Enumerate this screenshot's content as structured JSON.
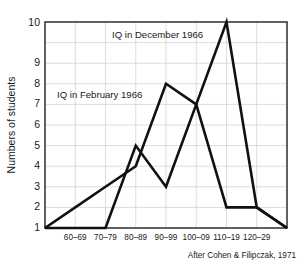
{
  "chart_data": {
    "type": "line",
    "title": "",
    "xlabel": "",
    "ylabel": "Numbers of students",
    "ylim": [
      0,
      10
    ],
    "yticks": [
      1,
      2,
      3,
      4,
      5,
      6,
      7,
      8,
      9,
      10
    ],
    "grid": true,
    "legend_position": "inline-annotations",
    "categories": [
      "60–69",
      "70–79",
      "80–89",
      "90–99",
      "100–09",
      "110–19",
      "120–29"
    ],
    "series": [
      {
        "name": "IQ in February 1966",
        "values": [
          1,
          2,
          3,
          7,
          6,
          1,
          1
        ],
        "start_edge_value": 0,
        "end_edge_value": 0
      },
      {
        "name": "IQ in December 1966",
        "values": [
          0,
          0,
          4,
          2,
          6,
          10,
          1
        ],
        "start_edge_value": 0,
        "end_edge_value": 0
      }
    ],
    "annotations": [
      {
        "text": "IQ in December 1966",
        "category": "90–99",
        "value": 9.4
      },
      {
        "text": "IQ in February 1966",
        "category": "70–79",
        "value": 6.7
      }
    ],
    "attribution": "After Cohen & Filipczak, 1971",
    "colors": {
      "line": "#111111",
      "grid": "#cfcfcf",
      "frame": "#3a3a3a",
      "background": "#ffffff"
    }
  },
  "ytick_labels": [
    "1",
    "2",
    "3",
    "4",
    "5",
    "6",
    "7",
    "8",
    "9",
    "10"
  ],
  "xtick_labels": [
    "60–69",
    "70–79",
    "80–89",
    "90–99",
    "100–09",
    "110–19",
    "120–29"
  ],
  "axis": {
    "ylabel": "Numbers of students"
  },
  "labels": {
    "december": "IQ in December 1966",
    "february": "IQ in February 1966"
  },
  "footer": {
    "attribution": "After Cohen & Filipczak, 1971"
  }
}
